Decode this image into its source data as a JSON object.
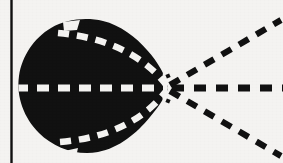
{
  "figure": {
    "background_color": "#f4f3f1",
    "ink_color": "#111111",
    "dash_color": "#f4f3f1",
    "canvas": {
      "width": 283,
      "height": 163
    }
  },
  "border": {
    "left_rule": {
      "name": "left vertical rule",
      "x": 11,
      "y_top": 0,
      "y_bottom": 163,
      "thickness": 2.2,
      "color": "#111111"
    }
  },
  "lobe": {
    "name": "main lobe",
    "fill_color": "#111111",
    "center_x": 92,
    "center_y": 88,
    "radius_x": 74,
    "radius_y": 67,
    "apex_x": 168,
    "apex_y": 88,
    "notches": [
      {
        "name": "top notch",
        "x": 66,
        "y": 24,
        "width": 14,
        "height": 8
      },
      {
        "name": "bottom notch",
        "x": 62,
        "y": 145,
        "width": 16,
        "height": 8
      }
    ]
  },
  "axes": {
    "apex_x": 168,
    "apex_y": 88,
    "dash_pattern": "9 7",
    "stroke_width": 6
  },
  "interior_dashes": [
    {
      "name": "interior-upper-dashed-arc",
      "start_x": 60,
      "start_y": 33,
      "ctrl_x": 132,
      "ctrl_y": 40,
      "end_x": 166,
      "end_y": 86,
      "color": "#f4f3f1"
    },
    {
      "name": "interior-axis-dashed-line",
      "start_x": 20,
      "start_y": 88,
      "ctrl_x": 94,
      "ctrl_y": 88,
      "end_x": 167,
      "end_y": 88,
      "color": "#f4f3f1"
    },
    {
      "name": "interior-lower-dashed-arc",
      "start_x": 62,
      "start_y": 142,
      "ctrl_x": 132,
      "ctrl_y": 136,
      "end_x": 166,
      "end_y": 90,
      "color": "#f4f3f1"
    }
  ],
  "exterior_rays": [
    {
      "name": "upper-right-dashed-ray",
      "start_x": 171,
      "start_y": 84,
      "end_x": 278,
      "end_y": 21,
      "angle_deg": 30,
      "color": "#111111"
    },
    {
      "name": "horizontal-dashed-ray",
      "start_x": 173,
      "start_y": 88,
      "end_x": 283,
      "end_y": 88,
      "angle_deg": 0,
      "color": "#111111"
    },
    {
      "name": "lower-right-dashed-ray",
      "start_x": 171,
      "start_y": 92,
      "end_x": 278,
      "end_y": 155,
      "angle_deg": -30,
      "color": "#111111"
    }
  ]
}
